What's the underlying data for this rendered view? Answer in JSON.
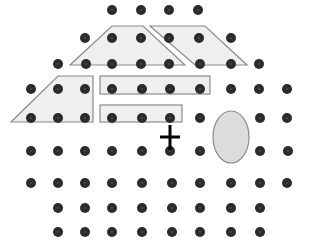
{
  "canvas": {
    "width": 309,
    "height": 247,
    "background": "#ffffff"
  },
  "colors": {
    "dot": "#2b2b2b",
    "dot_highlight": "#444444",
    "shape_fill": "#efefef",
    "shape_stroke": "#8a8a8a",
    "ellipse_fill": "#dcdcdc",
    "ellipse_stroke": "#8a8a8a",
    "cross": "#000000"
  },
  "dot_radius": 5,
  "dots": {
    "rows": [
      {
        "y": 10,
        "xs": [
          112,
          141,
          169,
          198
        ]
      },
      {
        "y": 38,
        "xs": [
          85,
          112,
          141,
          169,
          199,
          231
        ]
      },
      {
        "y": 64,
        "xs": [
          58,
          86,
          112,
          141,
          169,
          200,
          231,
          259
        ]
      },
      {
        "y": 89,
        "xs": [
          31,
          58,
          85,
          112,
          142,
          170,
          200,
          231,
          259,
          287
        ]
      },
      {
        "y": 118,
        "xs": [
          31,
          58,
          85,
          112,
          142,
          170,
          200,
          260,
          287
        ]
      },
      {
        "y": 151,
        "xs": [
          31,
          58,
          85,
          112,
          142,
          170,
          200,
          260,
          288
        ]
      },
      {
        "y": 183,
        "xs": [
          31,
          58,
          85,
          112,
          142,
          172,
          200,
          231,
          260,
          287
        ]
      },
      {
        "y": 208,
        "xs": [
          58,
          85,
          112,
          142,
          172,
          200,
          231,
          260
        ]
      },
      {
        "y": 232,
        "xs": [
          58,
          85,
          112,
          142,
          172,
          200,
          231,
          260
        ]
      }
    ]
  },
  "shapes": [
    {
      "name": "trapezoid-top",
      "type": "polygon",
      "points": [
        [
          112,
          26
        ],
        [
          143,
          26
        ],
        [
          185,
          65
        ],
        [
          70,
          65
        ]
      ]
    },
    {
      "name": "parallelogram-top-right",
      "type": "polygon",
      "points": [
        [
          150,
          26
        ],
        [
          205,
          26
        ],
        [
          247,
          65
        ],
        [
          195,
          65
        ]
      ]
    },
    {
      "name": "trapezoid-left",
      "type": "polygon",
      "points": [
        [
          58,
          76
        ],
        [
          93,
          76
        ],
        [
          93,
          122
        ],
        [
          11,
          122
        ]
      ]
    },
    {
      "name": "rectangle-middle",
      "type": "rect",
      "x": 100,
      "y": 76,
      "width": 110,
      "height": 18
    },
    {
      "name": "rectangle-lower",
      "type": "rect",
      "x": 100,
      "y": 105,
      "width": 82,
      "height": 17
    }
  ],
  "ellipse": {
    "cx": 231,
    "cy": 137,
    "rx": 18,
    "ry": 26
  },
  "cross": {
    "cx": 170,
    "cy": 137,
    "half_width": 10,
    "top": 125,
    "bottom": 150,
    "stroke_width": 3
  },
  "labels": {
    "figure": "Dot grid with overlaid shapes, ellipse and fixation cross"
  }
}
